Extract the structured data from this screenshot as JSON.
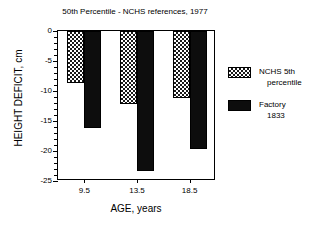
{
  "chart_data": {
    "type": "bar",
    "title": "50th Percentile - NCHS references, 1977",
    "xlabel": "AGE, years",
    "ylabel": "HEIGHT DEFICIT, cm",
    "categories": [
      "9.5",
      "13.5",
      "18.5"
    ],
    "ylim": [
      -25,
      0
    ],
    "yticks": [
      0,
      -5,
      -10,
      -15,
      -20,
      -25
    ],
    "ytick_labels": [
      "0",
      "-5",
      "-10",
      "-15",
      "-20",
      "-25"
    ],
    "y_minor_tick_step": 1,
    "grid": false,
    "legend_position": "right",
    "series": [
      {
        "name": "NCHS 5th percentile",
        "name_line1": "NCHS 5th",
        "name_line2": "percentile",
        "fill": "checkerboard",
        "color": "#1a1a1a",
        "values": [
          -8.6,
          -12.2,
          -11.1
        ]
      },
      {
        "name": "Factory 1833",
        "name_line1": "Factory",
        "name_line2": "1833",
        "fill": "solid",
        "color": "#0d0d0d",
        "values": [
          -16.2,
          -23.4,
          -19.6
        ]
      }
    ]
  }
}
